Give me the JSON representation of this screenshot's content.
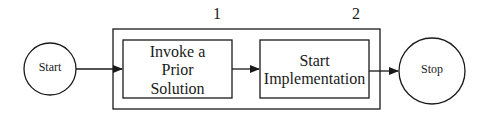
{
  "diagram": {
    "start": {
      "label": "Start"
    },
    "stop": {
      "label": "Stop"
    },
    "steps": [
      {
        "number": "1",
        "line1": "Invoke a",
        "line2": "Prior",
        "line3": "Solution"
      },
      {
        "number": "2",
        "line1": "Start",
        "line2": "Implementation"
      }
    ],
    "colors": {
      "stroke": "#1a1a1a",
      "background": "#ffffff"
    }
  }
}
